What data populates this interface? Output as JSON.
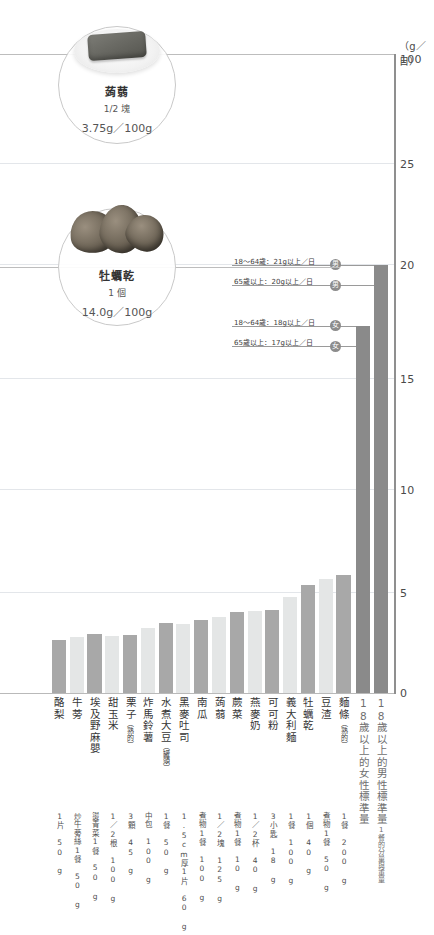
{
  "axis": {
    "unit": "（g／日）",
    "ticks": [
      {
        "label": "100",
        "value": 100
      },
      {
        "label": "25",
        "value": 25
      },
      {
        "label": "20",
        "value": 20
      },
      {
        "label": "15",
        "value": 15
      },
      {
        "label": "10",
        "value": 10
      },
      {
        "label": "5",
        "value": 5
      },
      {
        "label": "0",
        "value": 0
      }
    ]
  },
  "callouts": [
    {
      "name": "konjac",
      "title": "蒟蒻",
      "serving": "1/2 塊",
      "value": "3.75g／100g",
      "icon": "konjac-on-plate"
    },
    {
      "name": "dried-oyster",
      "title": "牡蠣乾",
      "serving": "1 個",
      "value": "14.0g／100g",
      "icon": "dried-oyster"
    }
  ],
  "references": [
    {
      "text": "18〜64歲：21g以上／日",
      "badge": "男",
      "value": 21
    },
    {
      "text": "65歲以上：20g以上／日",
      "badge": "男",
      "value": 20
    },
    {
      "text": "18〜64歲：18g以上／日",
      "badge": "女",
      "value": 18
    },
    {
      "text": "65歲以上：17g以上／日",
      "badge": "女",
      "value": 17
    }
  ],
  "colors": {
    "bar_dark": "#a8a8a8",
    "bar_light": "#e4e6e6",
    "bar_standard": "#8a8a8a",
    "axis": "#8f8f8f",
    "grid": "#e3e6ea",
    "badge": "#8c8c8c"
  },
  "chart_data": {
    "type": "bar",
    "title": "",
    "xlabel": "",
    "ylabel": "（g／日）",
    "ylim": [
      0,
      25
    ],
    "axis_break": {
      "below": 25,
      "top_tick": 100
    },
    "grid": true,
    "categories": [
      "酪梨",
      "牛蒡",
      "埃及野麻嬰",
      "甜玉米",
      "栗子（熟的）",
      "炸馬鈴薯",
      "水煮大豆（罐頭）",
      "黑麥吐司",
      "南瓜",
      "蒟蒻",
      "蕨菜",
      "燕麥奶",
      "可可粉",
      "義大利麵",
      "牡蠣乾",
      "豆渣",
      "麵條（熟的）",
      "18歲以上的女性標準量",
      "18歲以上的男性標準量"
    ],
    "category_parts": [
      {
        "main": "酪梨",
        "note": ""
      },
      {
        "main": "牛蒡",
        "note": ""
      },
      {
        "main": "埃及野麻嬰",
        "note": ""
      },
      {
        "main": "甜玉米",
        "note": ""
      },
      {
        "main": "栗子",
        "note": "（熟的）"
      },
      {
        "main": "炸馬鈴薯",
        "note": ""
      },
      {
        "main": "水煮大豆",
        "note": "（罐頭）"
      },
      {
        "main": "黑麥吐司",
        "note": ""
      },
      {
        "main": "南瓜",
        "note": ""
      },
      {
        "main": "蒟蒻",
        "note": ""
      },
      {
        "main": "蕨菜",
        "note": ""
      },
      {
        "main": "燕麥奶",
        "note": ""
      },
      {
        "main": "可可粉",
        "note": ""
      },
      {
        "main": "義大利麵",
        "note": ""
      },
      {
        "main": "牡蠣乾",
        "note": ""
      },
      {
        "main": "豆渣",
        "note": ""
      },
      {
        "main": "麵條",
        "note": "（熟的）"
      },
      {
        "main": "18歲以上的女性標準量",
        "note": ""
      },
      {
        "main": "18歲以上的男性標準量",
        "note": "1餐的分量與重量"
      }
    ],
    "servings": [
      "1片 50g",
      "炒牛蒡絲1餐 50g",
      "燙青菜1餐 50g",
      "1／2根 100g",
      "3顆 45g",
      "中包 100g",
      "1餐 50g",
      "1.5cm厚1片 60g",
      "煮物1餐 100g",
      "1／2塊 125g",
      "煮物1餐 10g",
      "1／2杯 40g",
      "3小匙 18g",
      "1餐 100g",
      "1個 40g",
      "煮物1餐 50g",
      "1餐 200g",
      "",
      ""
    ],
    "serving_lines": [
      [
        "1片",
        "50 g"
      ],
      [
        "炒牛蒡絲1餐",
        "50 g"
      ],
      [
        "燙青菜1餐",
        "50 g"
      ],
      [
        "1／2根",
        "100 g"
      ],
      [
        "3顆",
        "45 g"
      ],
      [
        "中包",
        "100 g"
      ],
      [
        "1餐",
        "50 g"
      ],
      [
        "1.5cm厚1片",
        "60 g"
      ],
      [
        "煮物1餐",
        "100 g"
      ],
      [
        "1／2塊",
        "125 g"
      ],
      [
        "煮物1餐",
        "10 g"
      ],
      [
        "1／2杯",
        "40 g"
      ],
      [
        "3小匙",
        "18 g"
      ],
      [
        "1餐",
        "100 g"
      ],
      [
        "1個",
        "40 g"
      ],
      [
        "煮物1餐",
        "50 g"
      ],
      [
        "1餐",
        "200 g"
      ],
      [
        ""
      ],
      [
        ""
      ]
    ],
    "values": [
      2.6,
      2.75,
      2.9,
      2.8,
      2.85,
      3.2,
      3.45,
      3.4,
      3.6,
      3.75,
      3.95,
      4.0,
      4.05,
      4.7,
      5.3,
      5.6,
      5.8,
      18.0,
      21.0
    ],
    "bar_kinds": [
      "dark",
      "light",
      "dark",
      "light",
      "dark",
      "light",
      "dark",
      "light",
      "dark",
      "light",
      "dark",
      "light",
      "dark",
      "light",
      "dark",
      "light",
      "dark",
      "standard",
      "standard"
    ]
  }
}
